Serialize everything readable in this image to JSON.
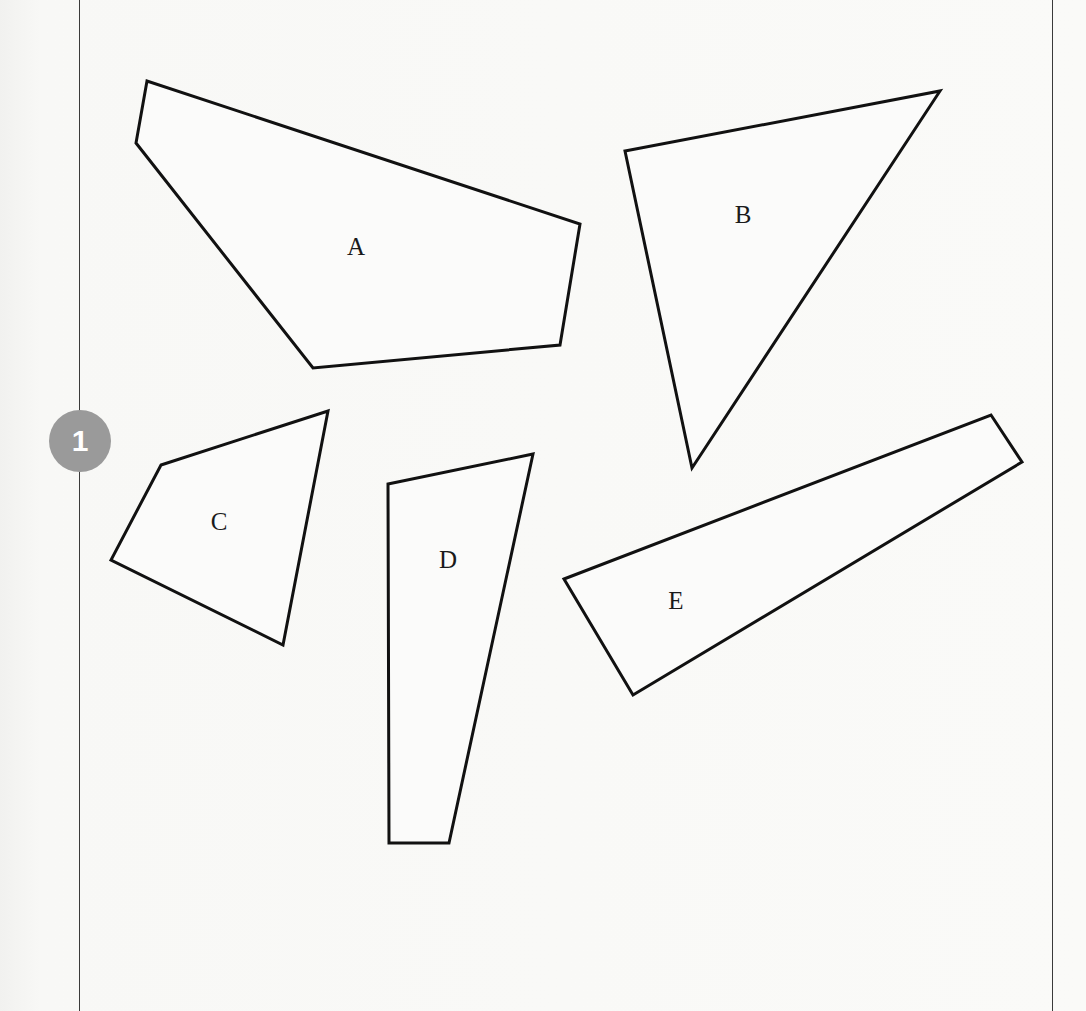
{
  "page": {
    "background": "#f7f7f5",
    "frame_color": "#3a3a3a",
    "stroke_color": "#111111"
  },
  "badge": {
    "number": "1",
    "color": "#9a9a9a"
  },
  "shapes": [
    {
      "label": "A",
      "type": "pentagon",
      "points": "147,81 136,143 313,368 560,345 580,224",
      "label_x": 356,
      "label_y": 255
    },
    {
      "label": "B",
      "type": "triangle",
      "points": "625,151 940,91 692,468",
      "label_x": 743,
      "label_y": 223
    },
    {
      "label": "C",
      "type": "quadrilateral",
      "points": "161,465 328,411 283,645 111,560",
      "label_x": 219,
      "label_y": 530
    },
    {
      "label": "D",
      "type": "quadrilateral",
      "points": "388,484 533,454 449,843 389,843",
      "label_x": 448,
      "label_y": 568
    },
    {
      "label": "E",
      "type": "quadrilateral",
      "points": "564,579 991,415 1022,462 633,695",
      "label_x": 676,
      "label_y": 609
    }
  ]
}
